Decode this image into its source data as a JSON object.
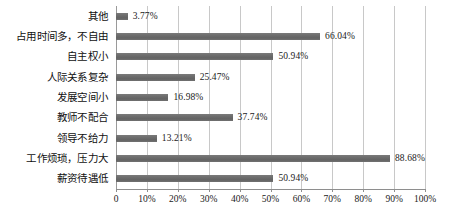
{
  "chart_data": {
    "type": "bar",
    "orientation": "horizontal",
    "title": "",
    "xlabel": "",
    "ylabel": "",
    "xlim": [
      0,
      100
    ],
    "grid": true,
    "legend": null,
    "bar_color": "#6b6b6b",
    "gridline_color": "#c8c8c8",
    "categories": [
      "其他",
      "占用时间多，不自由",
      "自主权小",
      "人际关系复杂",
      "发展空间小",
      "教师不配合",
      "领导不给力",
      "工作烦琐，压力大",
      "薪资待遇低"
    ],
    "values": [
      3.77,
      66.04,
      50.94,
      25.47,
      16.98,
      37.74,
      13.21,
      88.68,
      50.94
    ],
    "value_labels": [
      "3.77%",
      "66.04%",
      "50.94%",
      "25.47%",
      "16.98%",
      "37.74%",
      "13.21%",
      "88.68%",
      "50.94%"
    ],
    "xticks": [
      0,
      10,
      20,
      30,
      40,
      50,
      60,
      70,
      80,
      90,
      100
    ],
    "xtick_labels": [
      "0",
      "10%",
      "20%",
      "30%",
      "40%",
      "50%",
      "60%",
      "70%",
      "80%",
      "90%",
      "100%"
    ]
  },
  "caption": {
    "text": ""
  }
}
